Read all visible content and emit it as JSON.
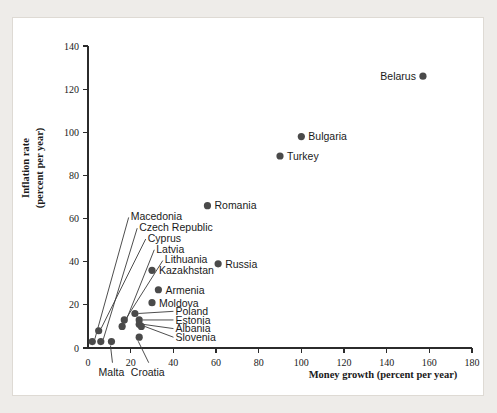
{
  "figure": {
    "background_color": "#eeece9",
    "panel_color": "#ffffff",
    "marker_color": "#4a4a4a",
    "axis_color": "#2b2b2b"
  },
  "chart_data": {
    "type": "scatter",
    "title": "",
    "xlabel": "Money growth (percent per year)",
    "ylabel": "Inflation rate (percent per year)",
    "ylabel_line1": "Inflation rate",
    "ylabel_line2": "(percent per year)",
    "xlim": [
      0,
      180
    ],
    "ylim": [
      0,
      140
    ],
    "xticks": [
      0,
      20,
      40,
      60,
      80,
      100,
      120,
      140,
      160,
      180
    ],
    "yticks": [
      0,
      20,
      40,
      60,
      80,
      100,
      120,
      140
    ],
    "xtick_labels": [
      "0",
      "20",
      "40",
      "60",
      "80",
      "100",
      "120",
      "140",
      "160",
      "180"
    ],
    "ytick_labels": [
      "0",
      "20",
      "40",
      "60",
      "80",
      "100",
      "120",
      "140"
    ],
    "grid": false,
    "legend": "none",
    "points": [
      {
        "name": "Belarus",
        "x": 157,
        "y": 126,
        "label_side": "left",
        "labeled": "direct"
      },
      {
        "name": "Bulgaria",
        "x": 100,
        "y": 98,
        "label_side": "right",
        "labeled": "direct"
      },
      {
        "name": "Turkey",
        "x": 90,
        "y": 89,
        "label_side": "right",
        "labeled": "direct"
      },
      {
        "name": "Romania",
        "x": 56,
        "y": 66,
        "label_side": "right",
        "labeled": "direct"
      },
      {
        "name": "Russia",
        "x": 61,
        "y": 39,
        "label_side": "right",
        "labeled": "direct"
      },
      {
        "name": "Kazakhstan",
        "x": 30,
        "y": 36,
        "label_side": "right",
        "labeled": "direct"
      },
      {
        "name": "Armenia",
        "x": 33,
        "y": 27,
        "label_side": "right",
        "labeled": "direct"
      },
      {
        "name": "Moldova",
        "x": 30,
        "y": 21,
        "label_side": "right",
        "labeled": "direct"
      },
      {
        "name": "Poland",
        "x": 22,
        "y": 16,
        "label_side": "right",
        "labeled": "leader"
      },
      {
        "name": "Estonia",
        "x": 24,
        "y": 13,
        "label_side": "right",
        "labeled": "leader"
      },
      {
        "name": "Albania",
        "x": 24,
        "y": 11,
        "label_side": "right",
        "labeled": "leader"
      },
      {
        "name": "Slovenia",
        "x": 25,
        "y": 10,
        "label_side": "right",
        "labeled": "leader"
      },
      {
        "name": "Macedonia",
        "x": 2,
        "y": 3,
        "label_side": "right",
        "labeled": "leader"
      },
      {
        "name": "Czech Republic",
        "x": 6,
        "y": 3,
        "label_side": "right",
        "labeled": "leader"
      },
      {
        "name": "Cyprus",
        "x": 5,
        "y": 8,
        "label_side": "right",
        "labeled": "leader"
      },
      {
        "name": "Latvia",
        "x": 16,
        "y": 10,
        "label_side": "right",
        "labeled": "leader"
      },
      {
        "name": "Lithuania",
        "x": 17,
        "y": 13,
        "label_side": "right",
        "labeled": "leader"
      },
      {
        "name": "Malta",
        "x": 11,
        "y": 3,
        "label_side": "below",
        "labeled": "leader"
      },
      {
        "name": "Croatia",
        "x": 24,
        "y": 5,
        "label_side": "below",
        "labeled": "leader"
      }
    ],
    "cluster_leader_labels": [
      {
        "name": "Macedonia",
        "label_x": 20,
        "label_y": 61
      },
      {
        "name": "Czech Republic",
        "label_x": 24,
        "label_y": 56
      },
      {
        "name": "Cyprus",
        "label_x": 28,
        "label_y": 51
      },
      {
        "name": "Latvia",
        "label_x": 32,
        "label_y": 46
      },
      {
        "name": "Lithuania",
        "label_x": 36,
        "label_y": 41
      }
    ],
    "inset_leader_labels": [
      {
        "name": "Poland",
        "label_x": 41,
        "label_y": 17
      },
      {
        "name": "Estonia",
        "label_x": 41,
        "label_y": 13
      },
      {
        "name": "Albania",
        "label_x": 41,
        "label_y": 9
      },
      {
        "name": "Slovenia",
        "label_x": 41,
        "label_y": 5
      }
    ],
    "below_axis_labels": [
      {
        "name": "Malta",
        "label_x": 11,
        "label_y": -11
      },
      {
        "name": "Croatia",
        "label_x": 28,
        "label_y": -11
      }
    ]
  }
}
